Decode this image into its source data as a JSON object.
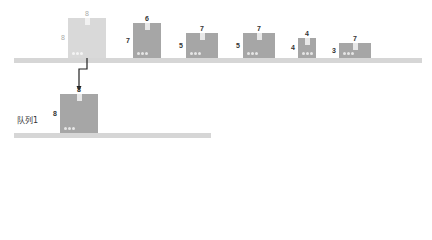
{
  "diagram": {
    "colors": {
      "shelf": "#d6d6d6",
      "box_dark": "#a6a6a6",
      "box_light": "#d9d9d9",
      "tab": "#e8e8e8",
      "arrow": "#222222"
    },
    "top_row": {
      "boxes": [
        {
          "top_label": "8",
          "side_label": "8",
          "state": "removed",
          "x": 68,
          "y": 18,
          "w": 38,
          "h": 40
        },
        {
          "top_label": "6",
          "side_label": "7",
          "state": "normal",
          "x": 133,
          "y": 23,
          "w": 28,
          "h": 35
        },
        {
          "top_label": "7",
          "side_label": "5",
          "state": "normal",
          "x": 186,
          "y": 33,
          "w": 32,
          "h": 25
        },
        {
          "top_label": "7",
          "side_label": "5",
          "state": "normal",
          "x": 243,
          "y": 33,
          "w": 32,
          "h": 25
        },
        {
          "top_label": "4",
          "side_label": "4",
          "state": "normal",
          "x": 298,
          "y": 38,
          "w": 18,
          "h": 20
        },
        {
          "top_label": "7",
          "side_label": "3",
          "state": "normal",
          "x": 339,
          "y": 43,
          "w": 32,
          "h": 15
        }
      ]
    },
    "queue": {
      "label": "队列1",
      "boxes": [
        {
          "top_label": "8",
          "side_label": "8",
          "state": "normal",
          "x": 60,
          "y": 94,
          "w": 38,
          "h": 39
        }
      ]
    }
  }
}
